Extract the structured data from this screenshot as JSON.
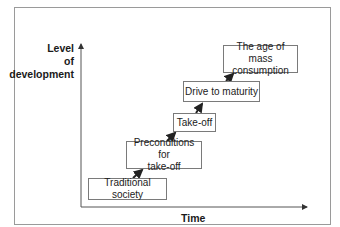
{
  "diagram": {
    "y_axis_label": [
      "Level",
      "of",
      "development"
    ],
    "x_axis_label": "Time",
    "stages": [
      {
        "label": "Traditional society"
      },
      {
        "label": "Preconditions for take-off",
        "lines": [
          "Preconditions for",
          "take-off"
        ]
      },
      {
        "label": "Take-off"
      },
      {
        "label": "Drive to maturity"
      },
      {
        "label": "The age of mass consumption",
        "lines": [
          "The age of mass",
          "consumption"
        ]
      }
    ]
  }
}
